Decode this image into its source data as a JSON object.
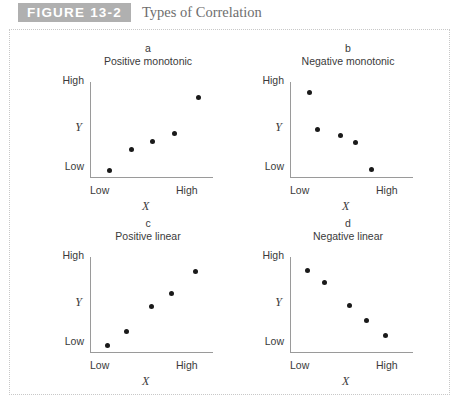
{
  "header": {
    "badge": "FIGURE 13-2",
    "title": "Types of Correlation",
    "badge_color": "#b0b0b0",
    "title_color": "#6e6e6e"
  },
  "axis_labels": {
    "y_high": "High",
    "y_low": "Low",
    "y_name": "Y",
    "x_low": "Low",
    "x_high": "High",
    "x_name": "X"
  },
  "chart_data": [
    {
      "type": "scatter",
      "panel": "a",
      "title": "Positive monotonic",
      "xlabel": "X",
      "ylabel": "Y",
      "xticklabels": [
        "Low",
        "High"
      ],
      "yticklabels": [
        "Low",
        "High"
      ],
      "xlim": [
        0,
        100
      ],
      "ylim": [
        0,
        100
      ],
      "grid": false,
      "legend": "none",
      "points": [
        {
          "x": 16,
          "y": 8
        },
        {
          "x": 34,
          "y": 30
        },
        {
          "x": 51,
          "y": 38
        },
        {
          "x": 69,
          "y": 46
        },
        {
          "x": 88,
          "y": 84
        }
      ]
    },
    {
      "type": "scatter",
      "panel": "b",
      "title": "Negative monotonic",
      "xlabel": "X",
      "ylabel": "Y",
      "xticklabels": [
        "Low",
        "High"
      ],
      "yticklabels": [
        "Low",
        "High"
      ],
      "xlim": [
        0,
        100
      ],
      "ylim": [
        0,
        100
      ],
      "grid": false,
      "legend": "none",
      "points": [
        {
          "x": 16,
          "y": 89
        },
        {
          "x": 22,
          "y": 51
        },
        {
          "x": 41,
          "y": 44
        },
        {
          "x": 53,
          "y": 37
        },
        {
          "x": 66,
          "y": 9
        }
      ]
    },
    {
      "type": "scatter",
      "panel": "c",
      "title": "Positive linear",
      "xlabel": "X",
      "ylabel": "Y",
      "xticklabels": [
        "Low",
        "High"
      ],
      "yticklabels": [
        "Low",
        "High"
      ],
      "xlim": [
        0,
        100
      ],
      "ylim": [
        0,
        100
      ],
      "grid": false,
      "legend": "none",
      "points": [
        {
          "x": 14,
          "y": 8
        },
        {
          "x": 30,
          "y": 22
        },
        {
          "x": 50,
          "y": 48
        },
        {
          "x": 66,
          "y": 62
        },
        {
          "x": 86,
          "y": 85
        }
      ]
    },
    {
      "type": "scatter",
      "panel": "d",
      "title": "Negative linear",
      "xlabel": "X",
      "ylabel": "Y",
      "xticklabels": [
        "Low",
        "High"
      ],
      "yticklabels": [
        "Low",
        "High"
      ],
      "xlim": [
        0,
        100
      ],
      "ylim": [
        0,
        100
      ],
      "grid": false,
      "legend": "none",
      "points": [
        {
          "x": 14,
          "y": 86
        },
        {
          "x": 28,
          "y": 73
        },
        {
          "x": 48,
          "y": 50
        },
        {
          "x": 62,
          "y": 34
        },
        {
          "x": 78,
          "y": 18
        }
      ]
    }
  ]
}
